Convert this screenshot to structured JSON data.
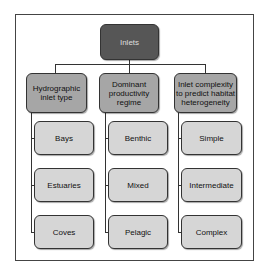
{
  "root": {
    "label": "Inlets"
  },
  "columns": [
    {
      "label": "Hydrographic inlet type",
      "children": [
        "Bays",
        "Estuaries",
        "Coves"
      ]
    },
    {
      "label": "Dominant productivity regime",
      "children": [
        "Benthic",
        "Mixed",
        "Pelagic"
      ]
    },
    {
      "label": "Inlet complexity to predict habitat heterogeneity",
      "children": [
        "Simple",
        "Intermediate",
        "Complex"
      ]
    }
  ],
  "colors": {
    "root": "#565656",
    "level1": "#a6a6a6",
    "leaf": "#d6d6d6",
    "line": "#333333"
  }
}
